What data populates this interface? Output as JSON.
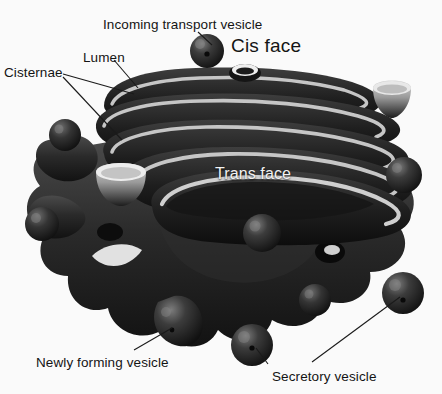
{
  "figure": {
    "width": 442,
    "height": 394,
    "background_color": "#fafafa"
  },
  "palette": {
    "background": "#fafafa",
    "membrane_dark": "#1a1a1a",
    "membrane_mid": "#3a3a3a",
    "membrane_light": "#6e6e6e",
    "lumen_line": "#c2c2c2",
    "lumen_fill": "#d8d8d8",
    "vesicle_dark": "#1c1c1c",
    "vesicle_highlight": "#6a6a6a",
    "label_text": "#141414",
    "label_text_light": "#f2f2f2",
    "leader_line": "#1a1a1a"
  },
  "labels": [
    {
      "id": "incoming-transport-vesicle",
      "text": "Incoming transport vesicle",
      "x": 103,
      "y": 18,
      "style": "dark",
      "font_size": 13.5
    },
    {
      "id": "cis-face",
      "text": "Cis face",
      "x": 231,
      "y": 38,
      "style": "dark-large",
      "font_size": 19
    },
    {
      "id": "lumen",
      "text": "Lumen",
      "x": 83,
      "y": 51,
      "style": "dark",
      "font_size": 13.5
    },
    {
      "id": "cisternae",
      "text": "Cisternae",
      "x": 4,
      "y": 66,
      "style": "dark",
      "font_size": 13.5
    },
    {
      "id": "trans-face",
      "text": "Trans face",
      "x": 215,
      "y": 166,
      "style": "light-on-art",
      "font_size": 16
    },
    {
      "id": "newly-forming-vesicle",
      "text": "Newly forming vesicle",
      "x": 36,
      "y": 356,
      "style": "dark",
      "font_size": 13.5
    },
    {
      "id": "secretory-vesicle",
      "text": "Secretory vesicle",
      "x": 272,
      "y": 370,
      "style": "dark",
      "font_size": 13.5
    }
  ],
  "leader_lines": [
    {
      "id": "leader-incoming-vesicle",
      "from_label": "incoming-transport-vesicle",
      "points": "198,32 210,44"
    },
    {
      "id": "leader-lumen",
      "from_label": "lumen",
      "points": "113,62 136,86"
    },
    {
      "id": "leader-cisternae-upper",
      "from_label": "cisternae",
      "points": "62,76 133,93"
    },
    {
      "id": "leader-cisternae-lower",
      "from_label": "cisternae",
      "points": "62,78 120,138"
    },
    {
      "id": "leader-newly-forming",
      "from_label": "newly-forming-vesicle",
      "points": "133,350 170,329"
    },
    {
      "id": "leader-secretory-left",
      "from_label": "secretory-vesicle",
      "points": "268,364 256,347"
    },
    {
      "id": "leader-secretory-right",
      "from_label": "secretory-vesicle",
      "points": "310,362 400,296"
    }
  ],
  "structures": [
    {
      "id": "cisterna-1",
      "name": "cisterna-stack-layer-cis",
      "order": 1
    },
    {
      "id": "cisterna-2",
      "name": "cisterna-stack-layer-2",
      "order": 2
    },
    {
      "id": "cisterna-3",
      "name": "cisterna-stack-layer-3",
      "order": 3
    },
    {
      "id": "cisterna-4",
      "name": "cisterna-stack-layer-4",
      "order": 4
    },
    {
      "id": "cisterna-5",
      "name": "cisterna-stack-layer-trans",
      "order": 5
    },
    {
      "id": "trans-body",
      "name": "trans-face-body",
      "order": 6
    }
  ],
  "vesicles": [
    {
      "id": "vesicle-incoming",
      "name": "incoming-transport-vesicle-shape",
      "cx": 207,
      "cy": 51,
      "r": 17,
      "type": "sphere"
    },
    {
      "id": "vesicle-ring-top",
      "name": "cis-face-pore-ring",
      "cx": 245,
      "cy": 72,
      "r": 15,
      "type": "ring"
    },
    {
      "id": "vesicle-cup-right",
      "name": "cup-shaped-vesicle",
      "cx": 392,
      "cy": 96,
      "r": 19,
      "type": "cup"
    },
    {
      "id": "vesicle-left-upper",
      "name": "budding-vesicle-left-upper",
      "cx": 65,
      "cy": 135,
      "r": 16,
      "type": "sphere"
    },
    {
      "id": "vesicle-left-lower",
      "name": "budding-vesicle-left-lower",
      "cx": 42,
      "cy": 224,
      "r": 17,
      "type": "sphere"
    },
    {
      "id": "vesicle-cup-mid-left",
      "name": "cup-shaped-vesicle-mid-left",
      "cx": 120,
      "cy": 180,
      "r": 22,
      "type": "cup"
    },
    {
      "id": "vesicle-center",
      "name": "budding-vesicle-center",
      "cx": 262,
      "cy": 233,
      "r": 19,
      "type": "sphere"
    },
    {
      "id": "vesicle-right-body",
      "name": "budding-vesicle-right",
      "cx": 404,
      "cy": 175,
      "r": 18,
      "type": "sphere"
    },
    {
      "id": "vesicle-newly-forming",
      "name": "newly-forming-vesicle-shape",
      "cx": 176,
      "cy": 324,
      "r": 21,
      "type": "sphere"
    },
    {
      "id": "vesicle-secretory-left",
      "name": "secretory-vesicle-left-shape",
      "cx": 252,
      "cy": 345,
      "r": 21,
      "type": "sphere"
    },
    {
      "id": "vesicle-secretory-right",
      "name": "secretory-vesicle-right-shape",
      "cx": 403,
      "cy": 293,
      "r": 21,
      "type": "sphere"
    },
    {
      "id": "vesicle-bottom-mid",
      "name": "budding-vesicle-bottom-mid",
      "cx": 315,
      "cy": 300,
      "r": 16,
      "type": "sphere"
    }
  ]
}
